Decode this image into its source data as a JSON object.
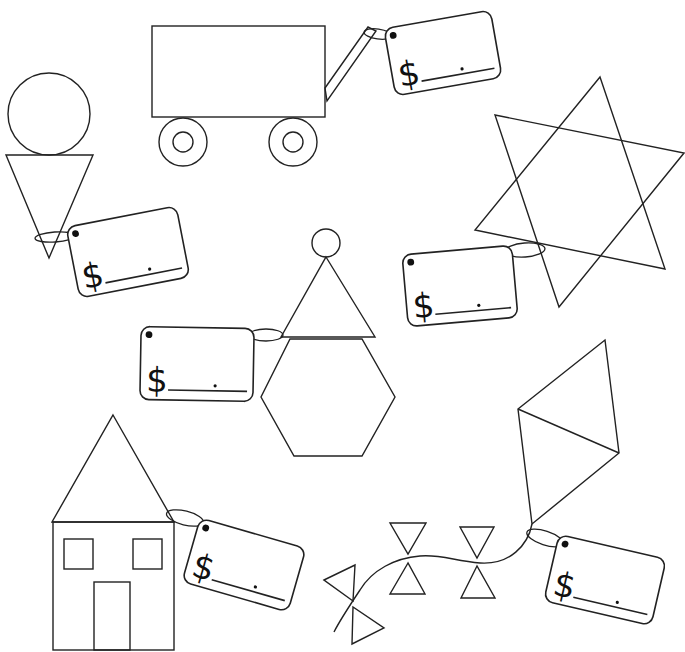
{
  "worksheet": {
    "stroke_color": "#222222",
    "background": "#ffffff",
    "currency_symbol": "$"
  },
  "shapes": {
    "wagon": {
      "body": {
        "x": 152,
        "y": 26,
        "w": 173,
        "h": 91
      },
      "wheels": [
        {
          "cx": 183,
          "cy": 142,
          "r_outer": 24,
          "r_inner": 10
        },
        {
          "cx": 293,
          "cy": 142,
          "r_outer": 24,
          "r_inner": 10
        }
      ],
      "handle": {
        "points": "325,88 368,27 376,31 327,101"
      }
    },
    "ice_cream": {
      "circle": {
        "cx": 49,
        "cy": 114,
        "r": 41
      },
      "triangle": "6,155 93,155 49,258"
    },
    "star": {
      "triangle_a": "600,77 665,269 475,230",
      "triangle_b": "495,115 684,153 559,307"
    },
    "snowman": {
      "circle": {
        "cx": 326,
        "cy": 243,
        "r": 14
      },
      "triangle": "326,257 375,337 281,337",
      "hexagon": "290,339 362,339 395,397 362,456 294,456 261,397"
    },
    "house": {
      "roof": "113,415 174,522 52,522",
      "body": {
        "x": 53,
        "y": 522,
        "w": 121,
        "h": 128
      },
      "windows": [
        {
          "x": 64,
          "y": 539,
          "w": 29,
          "h": 30
        },
        {
          "x": 133,
          "y": 539,
          "w": 29,
          "h": 30
        }
      ],
      "door": {
        "x": 94,
        "y": 582,
        "w": 36,
        "h": 68
      }
    },
    "kite": {
      "outline": "605,340 619,453 532,524 518,409",
      "crossbar": "518,409 619,453",
      "string": "M532,524 C528,545 510,565 480,563 C455,561 440,554 420,556 C395,558 372,570 360,590 C350,605 340,620 334,632",
      "bows": [
        {
          "top": "390,523 426,523 408,554",
          "bottom": "408,563 390,594 425,594"
        },
        {
          "top": "460,527 494,527 477,558",
          "bottom": "477,566 461,598 495,598"
        },
        {
          "top": "324,580 355,565 353,601",
          "bottom": "353,607 352,644 384,628"
        }
      ]
    }
  },
  "price_tags": [
    {
      "id": "wagon-tag",
      "cx": 443,
      "cy": 53,
      "w": 108,
      "h": 68,
      "rotate": -10,
      "loop": {
        "cx": 378,
        "cy": 34,
        "rx": 14,
        "ry": 5,
        "rotate": 8
      },
      "price_value": ""
    },
    {
      "id": "ice-cream-tag",
      "cx": 128,
      "cy": 252,
      "w": 112,
      "h": 72,
      "rotate": -11,
      "loop": {
        "cx": 55,
        "cy": 237,
        "rx": 20,
        "ry": 5,
        "rotate": -4
      },
      "price_value": ""
    },
    {
      "id": "star-tag",
      "cx": 460,
      "cy": 286,
      "w": 110,
      "h": 72,
      "rotate": -5,
      "loop": {
        "cx": 525,
        "cy": 250,
        "rx": 20,
        "ry": 7,
        "rotate": -4
      },
      "price_value": ""
    },
    {
      "id": "snowman-tag",
      "cx": 197,
      "cy": 364,
      "w": 113,
      "h": 73,
      "rotate": 1,
      "loop": {
        "cx": 266,
        "cy": 335,
        "rx": 17,
        "ry": 6,
        "rotate": 0
      },
      "price_value": ""
    },
    {
      "id": "house-tag",
      "cx": 244,
      "cy": 565,
      "w": 110,
      "h": 66,
      "rotate": 16,
      "loop": {
        "cx": 185,
        "cy": 518,
        "rx": 19,
        "ry": 7,
        "rotate": 14
      },
      "price_value": ""
    },
    {
      "id": "kite-tag",
      "cx": 605,
      "cy": 580,
      "w": 110,
      "h": 68,
      "rotate": 13,
      "loop": {
        "cx": 545,
        "cy": 538,
        "rx": 19,
        "ry": 7,
        "rotate": 18
      },
      "price_value": ""
    }
  ]
}
